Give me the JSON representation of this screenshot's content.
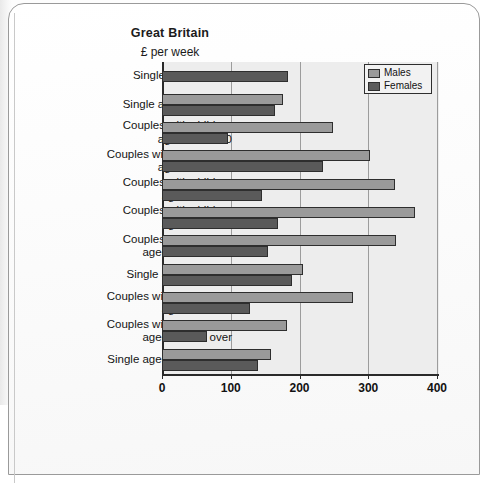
{
  "chart_data": {
    "type": "bar",
    "orientation": "horizontal",
    "title": "Great Britain",
    "subtitle": "£ per week",
    "xlabel": "",
    "ylabel": "",
    "xlim": [
      0,
      400
    ],
    "xticks": [
      0,
      100,
      200,
      300,
      400
    ],
    "xticklabels": [
      "0",
      "100",
      "200",
      "300",
      "400"
    ],
    "grid": true,
    "grid_axis": "x",
    "legend_position": "top-right",
    "categories": [
      "Single with children",
      "Single aged under 40",
      "Couples with children aged under 30",
      "Couples without children aged under 40",
      "Couples with children aged 30 to 39",
      "Couples with children aged 40 to 49",
      "Couples with children aged 50 and over",
      "Single aged 40 to 64",
      "Couples without children aged 40 to 64",
      "Couples without children aged 65 and over",
      "Single aged 65 and over"
    ],
    "category_lines": [
      [
        "Single with children"
      ],
      [
        "Single aged under 40"
      ],
      [
        "Couples with children",
        "aged under 30"
      ],
      [
        "Couples without children",
        "aged under 40"
      ],
      [
        "Couples with children",
        "aged 30 to 39"
      ],
      [
        "Couples with children",
        "aged 40 to 49"
      ],
      [
        "Couples with children",
        "aged 50 and over"
      ],
      [
        "Single aged 40 to 64"
      ],
      [
        "Couples without children",
        "aged 40 to 64"
      ],
      [
        "Couples without children",
        "aged 65 and over"
      ],
      [
        "Single aged 65 and over"
      ]
    ],
    "series": [
      {
        "name": "Males",
        "color": "#9a9a9a",
        "values": [
          null,
          176,
          248,
          302,
          339,
          368,
          341,
          205,
          278,
          182,
          158
        ]
      },
      {
        "name": "Females",
        "color": "#5a5a5a",
        "values": [
          183,
          164,
          96,
          234,
          145,
          168,
          154,
          189,
          128,
          66,
          140
        ]
      }
    ]
  },
  "legend": {
    "items": [
      {
        "label": "Males",
        "color": "#9a9a9a"
      },
      {
        "label": "Females",
        "color": "#5a5a5a"
      }
    ]
  },
  "colors": {
    "males": "#9a9a9a",
    "females": "#5a5a5a",
    "plot_background": "#ededed",
    "axis": "#2a2a2a",
    "gridline": "#9c9c9c"
  }
}
